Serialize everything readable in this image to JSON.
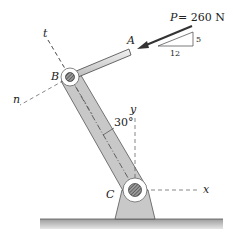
{
  "diagram": {
    "force": {
      "symbol": "P",
      "equals": " = 260 N",
      "magnitude": 260,
      "unit": "N",
      "slope_vertical": "5",
      "slope_horizontal": "12"
    },
    "points": {
      "A": "A",
      "B": "B",
      "C": "C"
    },
    "axes": {
      "t": "t",
      "n": "n",
      "x": "x",
      "y": "y"
    },
    "angle": "30°",
    "colors": {
      "member_fill": "#c8c8c8",
      "member_stroke": "#555555",
      "ground_fill": "#bdbdbd",
      "pin_hatch": "#555555",
      "line": "#333333"
    }
  }
}
